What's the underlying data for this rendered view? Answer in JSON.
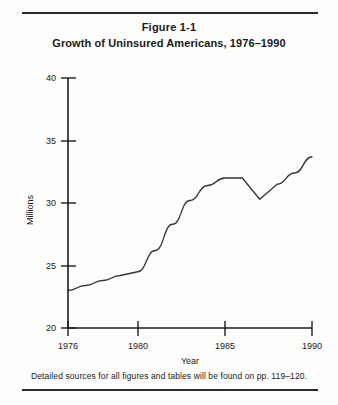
{
  "figure": {
    "number": "Figure 1-1",
    "title": "Growth of Uninsured Americans, 1976–1990",
    "footnote": "Detailed sources for all figures and tables will be found on pp. 119–120."
  },
  "axis": {
    "y_label": "Millions",
    "x_label": "Year",
    "y_ticks": [
      "20",
      "25",
      "30",
      "35",
      "40"
    ],
    "x_ticks": [
      "1976",
      "1980",
      "1985",
      "1990"
    ]
  },
  "colors": {
    "line": "#333333",
    "axis": "#1d1d1d",
    "text": "#1a1a1a",
    "background": "#fdfdfb",
    "rule": "#2a2a2a"
  },
  "chart_data": {
    "type": "line",
    "title": "Growth of Uninsured Americans, 1976–1990",
    "subtitle": "Figure 1-1",
    "xlabel": "Year",
    "ylabel": "Millions",
    "xlim": [
      1976,
      1990
    ],
    "ylim": [
      20,
      40
    ],
    "xticks": [
      1976,
      1980,
      1985,
      1990
    ],
    "yticks": [
      20,
      25,
      30,
      35,
      40
    ],
    "grid": false,
    "legend": false,
    "x": [
      1976,
      1977,
      1978,
      1979,
      1980,
      1981,
      1982,
      1983,
      1984,
      1985,
      1986,
      1987,
      1988,
      1989,
      1990
    ],
    "values": [
      23.0,
      23.4,
      23.8,
      24.2,
      24.5,
      26.2,
      28.3,
      30.2,
      31.4,
      32.0,
      32.0,
      30.3,
      31.5,
      32.4,
      33.7
    ],
    "series": [
      {
        "name": "Uninsured Americans",
        "values": [
          23.0,
          23.4,
          23.8,
          24.2,
          24.5,
          26.2,
          28.3,
          30.2,
          31.4,
          32.0,
          32.0,
          30.3,
          31.5,
          32.4,
          33.7
        ]
      }
    ]
  }
}
